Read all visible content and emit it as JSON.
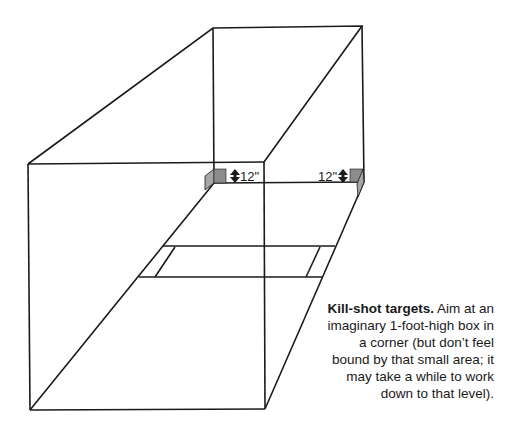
{
  "diagram": {
    "labels": {
      "left_corner_height": "12\"",
      "right_corner_height": "12\""
    },
    "icons": {
      "left_arrow": "double-arrow-vertical",
      "right_arrow": "double-arrow-vertical"
    },
    "colors": {
      "line": "#1a1a1a",
      "target_box_front": "#8c8c8c",
      "target_box_side": "#a6a6a6",
      "background": "#ffffff"
    }
  },
  "caption": {
    "heading": "Kill-shot targets.",
    "body": " Aim at an imaginary 1-foot-high box in a corner (but don’t feel bound by that small area; it may take a while to work down to that level)."
  }
}
